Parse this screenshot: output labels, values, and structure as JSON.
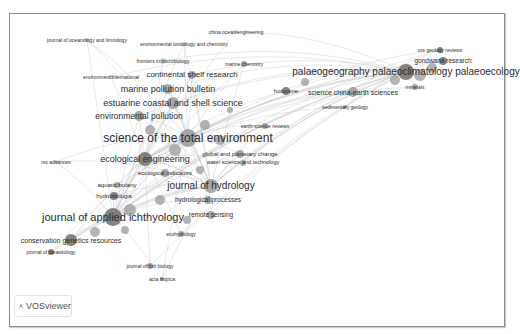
{
  "app": {
    "name": "VOSviewer"
  },
  "colors": {
    "edge": "#c8c8c8",
    "node_dark": "#6f6f6f",
    "node_mid": "#9a9a9a",
    "node_light": "#bdbdbd",
    "text": "#2b2b2b",
    "frame": "#8a8a8a"
  },
  "network": {
    "type": "journal co-citation network",
    "nodes": [
      {
        "label": "science of the total environment",
        "x": 188,
        "y": 138,
        "r": 9,
        "size": 12,
        "shade": "mid"
      },
      {
        "label": "journal of applied ichthyology",
        "x": 113,
        "y": 217,
        "r": 9,
        "size": 11,
        "shade": "dark"
      },
      {
        "label": "palaeogeography palaeoclimatology palaeoecology",
        "x": 406,
        "y": 72,
        "r": 8,
        "size": 10,
        "shade": "dark"
      },
      {
        "label": "journal of hydrology",
        "x": 211,
        "y": 186,
        "r": 7,
        "size": 10,
        "shade": "mid"
      },
      {
        "label": "estuarine coastal and shell science",
        "x": 173,
        "y": 103,
        "r": 6,
        "size": 9,
        "shade": "mid"
      },
      {
        "label": "marine pollution bulletin",
        "x": 168,
        "y": 89,
        "r": 5,
        "size": 9,
        "shade": "mid"
      },
      {
        "label": "ecological engineering",
        "x": 145,
        "y": 159,
        "r": 7,
        "size": 9,
        "shade": "dark"
      },
      {
        "label": "environmental pollution",
        "x": 139,
        "y": 116,
        "r": 5,
        "size": 8.5,
        "shade": "mid"
      },
      {
        "label": "continental shelf research",
        "x": 192,
        "y": 75,
        "r": 4,
        "size": 8,
        "shade": "mid"
      },
      {
        "label": "conservation genetics resources",
        "x": 71,
        "y": 240,
        "r": 6,
        "size": 7,
        "shade": "dark"
      },
      {
        "label": "science china-earth sciences",
        "x": 353,
        "y": 92,
        "r": 5,
        "size": 7,
        "shade": "mid"
      },
      {
        "label": "gondwana research",
        "x": 443,
        "y": 61,
        "r": 4,
        "size": 6.5,
        "shade": "dark"
      },
      {
        "label": "hydrological processes",
        "x": 208,
        "y": 200,
        "r": 4,
        "size": 6.5,
        "shade": "mid"
      },
      {
        "label": "remote sensing",
        "x": 211,
        "y": 215,
        "r": 4,
        "size": 6.5,
        "shade": "mid"
      },
      {
        "label": "global and planetary change",
        "x": 240,
        "y": 154,
        "r": 4,
        "size": 6,
        "shade": "mid"
      },
      {
        "label": "water science and technology",
        "x": 243,
        "y": 163,
        "r": 3,
        "size": 5.5,
        "shade": "mid"
      },
      {
        "label": "ecological indicators",
        "x": 165,
        "y": 173,
        "r": 4,
        "size": 6,
        "shade": "mid"
      },
      {
        "label": "aquatic botany",
        "x": 117,
        "y": 185,
        "r": 3,
        "size": 6,
        "shade": "mid"
      },
      {
        "label": "hydrobiologia",
        "x": 114,
        "y": 196,
        "r": 4,
        "size": 6,
        "shade": "dark"
      },
      {
        "label": "holocene",
        "x": 286,
        "y": 91,
        "r": 4,
        "size": 6,
        "shade": "dark"
      },
      {
        "label": "earth-science reviews",
        "x": 265,
        "y": 126,
        "r": 3,
        "size": 5,
        "shade": "mid"
      },
      {
        "label": "sedimentary geology",
        "x": 345,
        "y": 107,
        "r": 2,
        "size": 5,
        "shade": "mid"
      },
      {
        "label": "ore geology reviews",
        "x": 440,
        "y": 50,
        "r": 3,
        "size": 5,
        "shade": "dark"
      },
      {
        "label": "minerals",
        "x": 415,
        "y": 87,
        "r": 3,
        "size": 5,
        "shade": "mid"
      },
      {
        "label": "marine chemistry",
        "x": 244,
        "y": 64,
        "r": 3,
        "size": 5,
        "shade": "mid"
      },
      {
        "label": "frontiers in microbiology",
        "x": 163,
        "y": 61,
        "r": 3,
        "size": 5,
        "shade": "light"
      },
      {
        "label": "environmental toxicology and chemistry",
        "x": 184,
        "y": 44,
        "r": 2,
        "size": 5,
        "shade": "light"
      },
      {
        "label": "china ocean engineering",
        "x": 236,
        "y": 32,
        "r": 2,
        "size": 5,
        "shade": "light"
      },
      {
        "label": "journal of oceanology and limnology",
        "x": 87,
        "y": 40,
        "r": 2,
        "size": 5,
        "shade": "light"
      },
      {
        "label": "environment international",
        "x": 111,
        "y": 77,
        "r": 2,
        "size": 5,
        "shade": "light"
      },
      {
        "label": "rsc advances",
        "x": 56,
        "y": 162,
        "r": 2,
        "size": 5,
        "shade": "light"
      },
      {
        "label": "ecohydrology",
        "x": 181,
        "y": 234,
        "r": 3,
        "size": 5,
        "shade": "mid"
      },
      {
        "label": "journal of parasitology",
        "x": 51,
        "y": 252,
        "r": 3,
        "size": 5,
        "shade": "dark"
      },
      {
        "label": "journal of fish biology",
        "x": 150,
        "y": 266,
        "r": 3,
        "size": 5,
        "shade": "mid"
      },
      {
        "label": "acta tropica",
        "x": 162,
        "y": 279,
        "r": 2,
        "size": 5,
        "shade": "mid"
      }
    ]
  }
}
